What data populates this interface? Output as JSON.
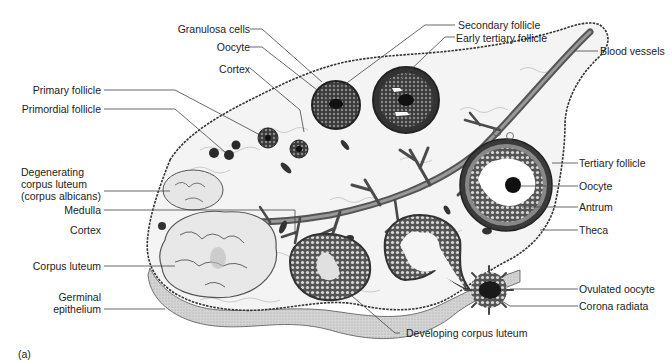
{
  "figure": {
    "panel_label": "(a)",
    "colors": {
      "tissue_fill": "#f2f2f2",
      "outline": "#3a3a3a",
      "vessel": "#5a5a5a",
      "dark_follicle": "#2a2a2a",
      "corpus_luteum": "#e4e4e4",
      "epithelium_shade": "#c9c9c9",
      "leader_line": "#444444"
    }
  },
  "labels": {
    "left": {
      "granulosa_cells": "Granulosa cells",
      "oocyte_top": "Oocyte",
      "cortex_top": "Cortex",
      "primary_follicle": "Primary follicle",
      "primordial_follicle": "Primordial follicle",
      "degenerating_corpus_luteum": "Degenerating\ncorpus luteum\n(corpus albicans)",
      "medulla": "Medulla",
      "cortex_left": "Cortex",
      "corpus_luteum": "Corpus luteum",
      "germinal_epithelium": "Germinal\nepithelium"
    },
    "top": {
      "secondary_follicle": "Secondary follicle",
      "early_tertiary_follicle": "Early tertiary follicle"
    },
    "right": {
      "blood_vessels": "Blood vessels",
      "tertiary_follicle": "Tertiary follicle",
      "oocyte_right": "Oocyte",
      "antrum": "Antrum",
      "theca": "Theca",
      "ovulated_oocyte": "Ovulated oocyte",
      "corona_radiata": "Corona radiata"
    },
    "bottom": {
      "developing_corpus_luteum": "Developing corpus luteum"
    }
  }
}
